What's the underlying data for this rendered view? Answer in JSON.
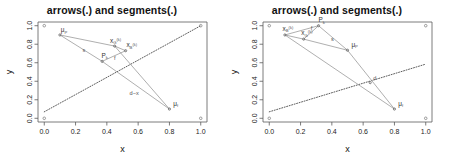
{
  "figure": {
    "panel_count": 2,
    "background": "#ffffff",
    "axis_color": "#5a5a5a",
    "line_color": "#9a9a9a",
    "dotted_color": "#4a4a4a",
    "point_color": "#777777"
  },
  "panels": [
    {
      "id": "left",
      "title": "arrows(.) and segments(.)",
      "axes": {
        "xlabel": "x",
        "ylabel": "y",
        "xticks": [
          "0.0",
          "0.2",
          "0.4",
          "0.6",
          "0.8",
          "1.0"
        ],
        "yticks": [
          "0.0",
          "0.2",
          "0.4",
          "0.6",
          "0.8",
          "1.0"
        ],
        "xlim": [
          -0.04,
          1.04
        ],
        "ylim": [
          -0.04,
          1.04
        ],
        "grid": false
      },
      "labels": {
        "mu_P": "μP",
        "mu_f": "μf",
        "x_G": "x",
        "x_B": "x",
        "P": "P",
        "f": "f",
        "s": "s",
        "d_minus_x": "d−x",
        "sub_G": "G",
        "sub_B": "B",
        "sub_k": "k",
        "sup_k": "(k)"
      }
    },
    {
      "id": "right",
      "title": "arrows(.) and segments(.)",
      "axes": {
        "xlabel": "x",
        "ylabel": "y",
        "xticks": [
          "0.0",
          "0.2",
          "0.4",
          "0.6",
          "0.8",
          "1.0"
        ],
        "yticks": [
          "0.0",
          "0.2",
          "0.4",
          "0.6",
          "0.8",
          "1.0"
        ],
        "xlim": [
          -0.04,
          1.04
        ],
        "ylim": [
          -0.04,
          1.04
        ],
        "grid": false
      },
      "labels": {
        "mu_P": "μP",
        "mu_f": "μf",
        "x_G": "x",
        "x_B": "x",
        "P": "P",
        "f": "f",
        "s": "s",
        "d": "d",
        "sub_G": "G",
        "sub_B": "B",
        "sub_k": "k",
        "sup_k": "(k)"
      }
    }
  ],
  "chart_data": [
    {
      "type": "scatter",
      "panel": "left",
      "title": "arrows(.) and segments(.)",
      "xlabel": "x",
      "ylabel": "y",
      "xlim": [
        -0.04,
        1.04
      ],
      "ylim": [
        -0.04,
        1.04
      ],
      "grid": false,
      "corner_points": [
        {
          "x": 0.0,
          "y": 0.0
        },
        {
          "x": 0.0,
          "y": 1.0
        },
        {
          "x": 1.0,
          "y": 0.0
        },
        {
          "x": 1.0,
          "y": 1.0
        }
      ],
      "points": [
        {
          "name": "mu_P",
          "x": 0.1,
          "y": 0.9,
          "label": "μP"
        },
        {
          "name": "x_G_k",
          "x": 0.45,
          "y": 0.78,
          "label": "xG(k)"
        },
        {
          "name": "x_B_k",
          "x": 0.52,
          "y": 0.73,
          "label": "xB(k)"
        },
        {
          "name": "P_k",
          "x": 0.37,
          "y": 0.615,
          "label": "Pk"
        },
        {
          "name": "mu_f",
          "x": 0.8,
          "y": 0.1,
          "label": "μf"
        }
      ],
      "segments": [
        {
          "name": "mu_P-to-x_G",
          "x1": 0.1,
          "y1": 0.9,
          "x2": 0.45,
          "y2": 0.78
        },
        {
          "name": "x_G-to-x_B",
          "x1": 0.45,
          "y1": 0.78,
          "x2": 0.52,
          "y2": 0.73
        },
        {
          "name": "mu_P-to-P_k",
          "x1": 0.1,
          "y1": 0.9,
          "x2": 0.37,
          "y2": 0.615
        },
        {
          "name": "P_k-to-x_B",
          "x1": 0.37,
          "y1": 0.615,
          "x2": 0.52,
          "y2": 0.73
        },
        {
          "name": "x_G-to-mu_f",
          "x1": 0.45,
          "y1": 0.78,
          "x2": 0.8,
          "y2": 0.1
        },
        {
          "name": "P_k-to-mu_f",
          "x1": 0.37,
          "y1": 0.615,
          "x2": 0.8,
          "y2": 0.1
        }
      ],
      "dotted_line": {
        "name": "diagonal",
        "x1": 0.0,
        "y1": 0.07,
        "x2": 1.0,
        "y2": 1.0
      },
      "annotations": [
        {
          "text": "μP",
          "x": 0.105,
          "y": 0.93
        },
        {
          "text": "xG(k)",
          "x": 0.42,
          "y": 0.815
        },
        {
          "text": "xB(k)",
          "x": 0.525,
          "y": 0.765
        },
        {
          "text": "Pk",
          "x": 0.365,
          "y": 0.655
        },
        {
          "text": "f",
          "x": 0.445,
          "y": 0.625
        },
        {
          "text": "s",
          "x": 0.245,
          "y": 0.72
        },
        {
          "text": "d−x",
          "x": 0.545,
          "y": 0.255
        },
        {
          "text": "μf",
          "x": 0.825,
          "y": 0.135
        }
      ]
    },
    {
      "type": "scatter",
      "panel": "right",
      "title": "arrows(.) and segments(.)",
      "xlabel": "x",
      "ylabel": "y",
      "xlim": [
        -0.04,
        1.04
      ],
      "ylim": [
        -0.04,
        1.04
      ],
      "grid": false,
      "corner_points": [
        {
          "x": 0.0,
          "y": 0.0
        },
        {
          "x": 0.0,
          "y": 1.0
        },
        {
          "x": 1.0,
          "y": 0.0
        },
        {
          "x": 1.0,
          "y": 1.0
        }
      ],
      "points": [
        {
          "name": "x_B_k",
          "x": 0.1,
          "y": 0.9,
          "label": "xB(k)"
        },
        {
          "name": "x_G_k",
          "x": 0.22,
          "y": 0.855,
          "label": "xG(k)"
        },
        {
          "name": "P_k",
          "x": 0.315,
          "y": 1.0,
          "label": "Pk"
        },
        {
          "name": "mu_P",
          "x": 0.5,
          "y": 0.735,
          "label": "μP"
        },
        {
          "name": "d_point",
          "x": 0.645,
          "y": 0.385,
          "label": "d"
        },
        {
          "name": "mu_f",
          "x": 0.8,
          "y": 0.1,
          "label": "μf"
        }
      ],
      "segments": [
        {
          "name": "x_B-to-x_G",
          "x1": 0.1,
          "y1": 0.9,
          "x2": 0.22,
          "y2": 0.855
        },
        {
          "name": "x_G-to-P_k",
          "x1": 0.22,
          "y1": 0.855,
          "x2": 0.315,
          "y2": 1.0
        },
        {
          "name": "x_B-to-P_k",
          "x1": 0.1,
          "y1": 0.9,
          "x2": 0.315,
          "y2": 1.0
        },
        {
          "name": "P_k-to-mu_P",
          "x1": 0.315,
          "y1": 1.0,
          "x2": 0.5,
          "y2": 0.735
        },
        {
          "name": "x_G-to-mu_P",
          "x1": 0.22,
          "y1": 0.855,
          "x2": 0.5,
          "y2": 0.735
        },
        {
          "name": "x_B-to-mu_f",
          "x1": 0.1,
          "y1": 0.9,
          "x2": 0.8,
          "y2": 0.1
        },
        {
          "name": "mu_P-to-mu_f",
          "x1": 0.5,
          "y1": 0.735,
          "x2": 0.8,
          "y2": 0.1
        }
      ],
      "dotted_line": {
        "name": "diagonal",
        "x1": 0.0,
        "y1": 0.07,
        "x2": 1.0,
        "y2": 0.585
      },
      "annotations": [
        {
          "text": "xB(k)",
          "x": 0.085,
          "y": 0.945
        },
        {
          "text": "xG(k)",
          "x": 0.205,
          "y": 0.9
        },
        {
          "text": "Pk",
          "x": 0.315,
          "y": 1.04
        },
        {
          "text": "f",
          "x": 0.265,
          "y": 0.955
        },
        {
          "text": "s",
          "x": 0.395,
          "y": 0.84
        },
        {
          "text": "μP",
          "x": 0.525,
          "y": 0.775
        },
        {
          "text": "d",
          "x": 0.665,
          "y": 0.415
        },
        {
          "text": "μf",
          "x": 0.825,
          "y": 0.135
        }
      ]
    }
  ]
}
